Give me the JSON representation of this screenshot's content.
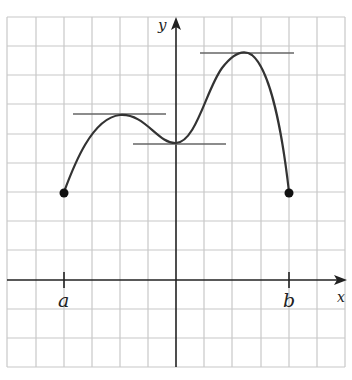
{
  "diagram": {
    "axes": {
      "x_label": "x",
      "y_label": "y"
    },
    "interval": {
      "left_label": "a",
      "right_label": "b"
    },
    "grid": {
      "columns": 12,
      "rows": 12,
      "color": "#c8c8c8"
    },
    "colors": {
      "curve": "#333333",
      "tangent": "#666666",
      "axis": "#222222",
      "point": "#111111"
    },
    "features": [
      {
        "type": "endpoint",
        "label": "a",
        "x": -4,
        "y": 3
      },
      {
        "type": "local-max",
        "tangent": "horizontal",
        "x": -2,
        "y": 5.8
      },
      {
        "type": "local-min",
        "tangent": "horizontal",
        "x": 0,
        "y": 4.7
      },
      {
        "type": "local-max",
        "tangent": "horizontal",
        "x": 2.3,
        "y": 7.7
      },
      {
        "type": "endpoint",
        "label": "b",
        "x": 4,
        "y": 3
      }
    ]
  }
}
